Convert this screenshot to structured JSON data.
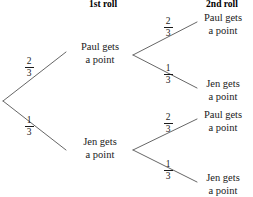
{
  "diagram": {
    "type": "probability-tree",
    "headers": [
      {
        "label": "1st roll"
      },
      {
        "label": "2nd roll"
      }
    ],
    "root": {
      "branches": [
        {
          "probability_numerator": "2",
          "probability_denominator": "3",
          "outcome_line1": "Paul gets",
          "outcome_line2": "a point",
          "children": [
            {
              "probability_numerator": "2",
              "probability_denominator": "3",
              "outcome_line1": "Paul gets",
              "outcome_line2": "a point"
            },
            {
              "probability_numerator": "1",
              "probability_denominator": "3",
              "outcome_line1": "Jen gets",
              "outcome_line2": "a point"
            }
          ]
        },
        {
          "probability_numerator": "1",
          "probability_denominator": "3",
          "outcome_line1": "Jen gets",
          "outcome_line2": "a point",
          "children": [
            {
              "probability_numerator": "2",
              "probability_denominator": "3",
              "outcome_line1": "Paul gets",
              "outcome_line2": "a point"
            },
            {
              "probability_numerator": "1",
              "probability_denominator": "3",
              "outcome_line1": "Jen gets",
              "outcome_line2": "a point"
            }
          ]
        }
      ]
    },
    "colors": {
      "background": "#ffffff",
      "ink": "#1a1a1a",
      "line": "#555555"
    }
  }
}
